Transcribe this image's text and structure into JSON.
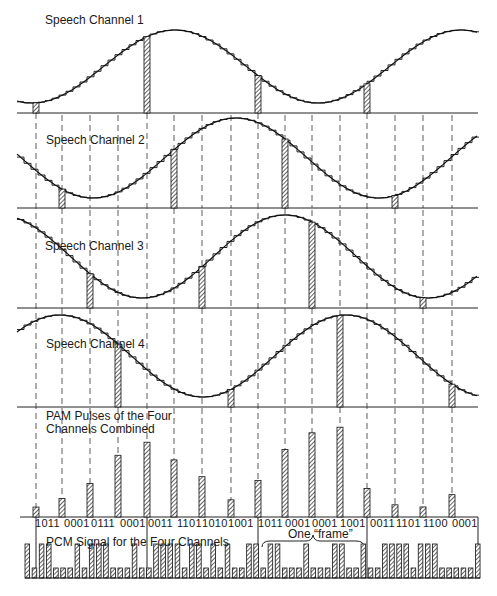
{
  "diagram": {
    "panels": [
      {
        "label": "Speech Channel 1",
        "baseline_y": 113
      },
      {
        "label": "Speech Channel 2",
        "baseline_y": 208
      },
      {
        "label": "Speech Channel 3",
        "baseline_y": 308
      },
      {
        "label": "Speech Channel 4",
        "baseline_y": 407
      }
    ],
    "pam": {
      "label_line1": "PAM Pulses of the Four",
      "label_line2": "Channels Combined",
      "baseline_y": 517
    },
    "codes": [
      {
        "text": "1011",
        "x": 35
      },
      {
        "text": "0001",
        "x": 64
      },
      {
        "text": "0111",
        "x": 91
      },
      {
        "text": "0001",
        "x": 120
      },
      {
        "text": "0011",
        "x": 148
      },
      {
        "text": "1101",
        "x": 177
      },
      {
        "text": "1010",
        "x": 202
      },
      {
        "text": "1001",
        "x": 228
      },
      {
        "text": "1011",
        "x": 258
      },
      {
        "text": "0001",
        "x": 285
      },
      {
        "text": "0001",
        "x": 312
      },
      {
        "text": "1001",
        "x": 340
      },
      {
        "text": "0011",
        "x": 370
      },
      {
        "text": "1101",
        "x": 396
      },
      {
        "text": "1100",
        "x": 423
      },
      {
        "text": "0001",
        "x": 452
      }
    ],
    "frame_label": "One “frame”",
    "pcm_label": "PCM Signal for the Four Channels"
  }
}
